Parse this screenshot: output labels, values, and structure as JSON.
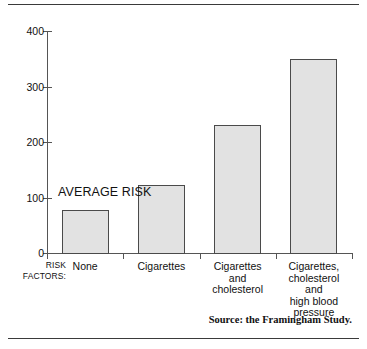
{
  "chart_data": {
    "type": "bar",
    "title": "",
    "subtitle": "",
    "xlabel": "RISK FACTORS:",
    "ylabel": "",
    "ylim": [
      0,
      400
    ],
    "yticks": [
      0,
      100,
      200,
      300,
      400
    ],
    "ytick_labels": [
      "0",
      "100",
      "200",
      "300",
      "400"
    ],
    "grid": false,
    "legend": null,
    "categories": [
      "None",
      "Cigarettes",
      "Cigarettes and cholesterol",
      "Cigarettes, cholesterol and high blood pressure"
    ],
    "category_lines": [
      [
        "None"
      ],
      [
        "Cigarettes"
      ],
      [
        "Cigarettes",
        "and",
        "cholesterol"
      ],
      [
        "Cigarettes,",
        "cholesterol",
        "and",
        "high blood",
        "pressure"
      ]
    ],
    "values": [
      78,
      123,
      230,
      350
    ],
    "annotations": [
      {
        "text": "AVERAGE RISK",
        "value": 100
      }
    ],
    "source": "Source: the Framingham Study.",
    "colors": {
      "bar_fill": "#e2e2e2",
      "bar_stroke": "#4a4a4a",
      "axis": "#555555",
      "text": "#111111",
      "rule": "#3a3a3a",
      "background": "#ffffff"
    }
  },
  "axis": {
    "y": {
      "ticks": [
        {
          "label": "400",
          "value": 400
        },
        {
          "label": "300",
          "value": 300
        },
        {
          "label": "200",
          "value": 200
        },
        {
          "label": "100",
          "value": 100
        },
        {
          "label": "0",
          "value": 0
        }
      ]
    }
  },
  "labels": {
    "risk_factors_line1": "RISK",
    "risk_factors_line2": "FACTORS:",
    "average_risk": "AVERAGE RISK",
    "source": "Source: the Framingham Study."
  }
}
